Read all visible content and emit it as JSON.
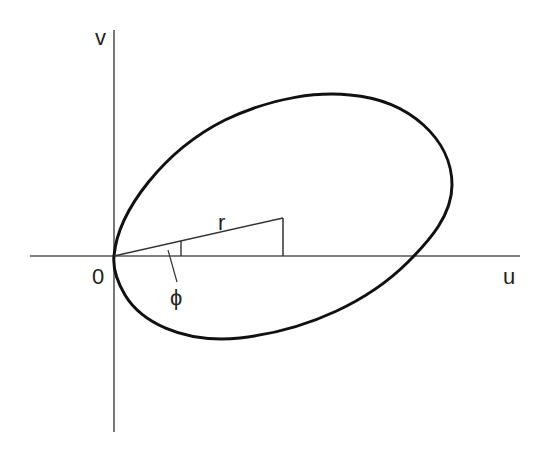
{
  "diagram": {
    "axes": {
      "horizontal_label": "u",
      "vertical_label": "v",
      "origin_label": "0"
    },
    "annotations": {
      "radius_label": "r",
      "angle_label": "ϕ"
    },
    "colors": {
      "curve": "#111111",
      "axis": "#444444",
      "background": "#ffffff"
    }
  }
}
